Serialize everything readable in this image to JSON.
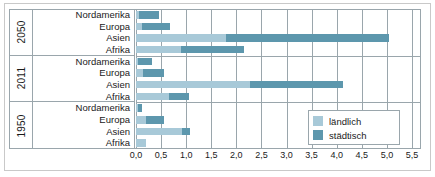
{
  "chart_data": {
    "type": "bar",
    "orientation": "horizontal",
    "stacked": true,
    "title": "",
    "xlabel": "",
    "ylabel": "",
    "xlim": [
      0.0,
      5.5
    ],
    "xticks": [
      0.0,
      0.5,
      1.0,
      1.5,
      2.0,
      2.5,
      3.0,
      3.5,
      4.0,
      4.5,
      5.0,
      5.5
    ],
    "xtick_labels": [
      "0,0",
      "0,5",
      "1,0",
      "1,5",
      "2,0",
      "2,5",
      "3,0",
      "3,5",
      "4,0",
      "4,5",
      "5,0",
      "5,5"
    ],
    "grid": true,
    "legend_position": "bottom-right",
    "legend": [
      "ländlich",
      "städtisch"
    ],
    "series": [
      {
        "name": "ländlich",
        "color": "#a8c9d8"
      },
      {
        "name": "städtisch",
        "color": "#5d97ad"
      }
    ],
    "groups": [
      {
        "year": "2050",
        "categories": [
          "Nordamerika",
          "Europa",
          "Asien",
          "Afrika"
        ],
        "rural": [
          0.05,
          0.12,
          1.8,
          0.9
        ],
        "urban": [
          0.4,
          0.56,
          3.25,
          1.25
        ],
        "totals": [
          0.45,
          0.68,
          5.05,
          2.15
        ]
      },
      {
        "year": "2011",
        "categories": [
          "Nordamerika",
          "Europa",
          "Asien",
          "Afrika"
        ],
        "rural": [
          0.04,
          0.14,
          2.27,
          0.65
        ],
        "urban": [
          0.28,
          0.41,
          1.85,
          0.4
        ],
        "totals": [
          0.32,
          0.55,
          4.12,
          1.05
        ]
      },
      {
        "year": "1950",
        "categories": [
          "Nordamerika",
          "Europa",
          "Asien",
          "Afrika"
        ],
        "rural": [
          0.04,
          0.2,
          0.92,
          0.2
        ],
        "urban": [
          0.08,
          0.35,
          0.16,
          0.0
        ],
        "totals": [
          0.12,
          0.55,
          1.08,
          0.2
        ]
      }
    ]
  },
  "axis": {
    "ticks": [
      {
        "value": 0.0,
        "label": "0,0"
      },
      {
        "value": 0.5,
        "label": "0,5"
      },
      {
        "value": 1.0,
        "label": "1,0"
      },
      {
        "value": 1.5,
        "label": "1,5"
      },
      {
        "value": 2.0,
        "label": "2,0"
      },
      {
        "value": 2.5,
        "label": "2,5"
      },
      {
        "value": 3.0,
        "label": "3,0"
      },
      {
        "value": 3.5,
        "label": "3,5"
      },
      {
        "value": 4.0,
        "label": "4,0"
      },
      {
        "value": 4.5,
        "label": "4,5"
      },
      {
        "value": 5.0,
        "label": "5,0"
      },
      {
        "value": 5.5,
        "label": "5,5"
      }
    ]
  },
  "legend": {
    "items": [
      {
        "label": "ländlich",
        "color": "#a8c9d8",
        "key": "rural"
      },
      {
        "label": "städtisch",
        "color": "#5d97ad",
        "key": "urban"
      }
    ]
  },
  "colors": {
    "rural": "#a8c9d8",
    "urban": "#5d97ad",
    "grid": "#9aa6ac",
    "frame": "#c9c9c9",
    "text": "#1a1a1a",
    "background": "#ffffff"
  }
}
